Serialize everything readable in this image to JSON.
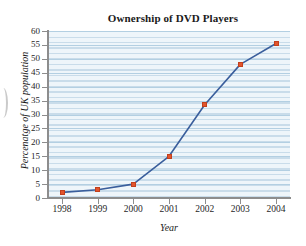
{
  "chart_data": {
    "type": "line",
    "title": "Ownership of DVD Players",
    "xlabel": "Year",
    "ylabel": "Percenatge of UK population",
    "categories": [
      "1998",
      "1999",
      "2000",
      "2001",
      "2002",
      "2003",
      "2004"
    ],
    "x": [
      1998,
      1999,
      2000,
      2001,
      2002,
      2003,
      2004
    ],
    "values": [
      2,
      3,
      5,
      15,
      33.5,
      48,
      55.5
    ],
    "series": [
      {
        "name": "Percenatge of UK population",
        "values": [
          2,
          3,
          5,
          15,
          33.5,
          48,
          55.5
        ]
      }
    ],
    "ylim": [
      0,
      60
    ],
    "xlim": [
      1998,
      2004
    ],
    "ytick_labels": [
      "60",
      "55",
      "50",
      "45",
      "40",
      "35",
      "30",
      "25",
      "20",
      "15",
      "10",
      "5",
      "0"
    ],
    "ytick_values": [
      60,
      55,
      50,
      45,
      40,
      35,
      30,
      25,
      20,
      15,
      10,
      5,
      0
    ],
    "ytick_step": 5,
    "xtick_labels": [
      "1998",
      "1999",
      "2000",
      "2001",
      "2002",
      "2003",
      "2004"
    ],
    "grid": true,
    "grid_orientation": "horizontal",
    "legend": false,
    "legend_position": "none",
    "marker": "square",
    "line_color": "#3a5e9c",
    "marker_color": "#e2542c",
    "plot_background": "#eef5fa",
    "grid_color": "#c9dcea",
    "axis_color": "#8d8d8d",
    "text_color": "#1a1a1a"
  }
}
